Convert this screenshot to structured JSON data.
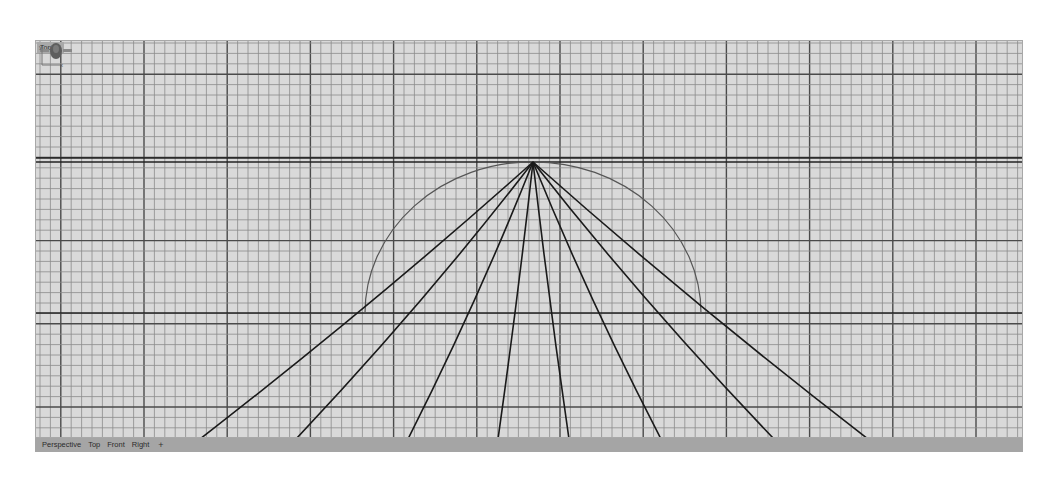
{
  "viewport": {
    "name": "Top",
    "label_icon": "viewport-menu-arrow-icon",
    "background": "#d9d9d9",
    "grid": {
      "minor_spacing_px": 10.4,
      "minor_color": "#8c8c8c",
      "major_color": "#4a4a4a"
    },
    "axis_icon": {
      "y_label": "y",
      "x_label": "x"
    },
    "navigation_widget_icon": "gumball-rotate-icon"
  },
  "drawing": {
    "apex": [
      497,
      121
    ],
    "arc": {
      "center": [
        497,
        272
      ],
      "radius": 168,
      "color": "#555555"
    },
    "horizon_lines_y": [
      117,
      121
    ],
    "ground_line_y": 272,
    "rays_bottom_x": [
      164,
      260,
      372,
      462,
      533,
      625,
      738,
      832
    ],
    "ray_color": "#1a1a1a"
  },
  "tabs": [
    {
      "label": "Perspective"
    },
    {
      "label": "Top"
    },
    {
      "label": "Front"
    },
    {
      "label": "Right"
    }
  ],
  "tab_add_label": "+"
}
